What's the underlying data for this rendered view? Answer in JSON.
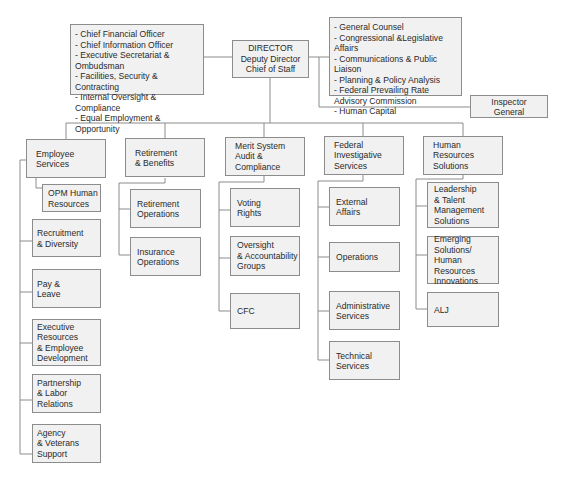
{
  "director": {
    "text": "DIRECTOR\nDeputy Director\nChief of Staff"
  },
  "left_staff": {
    "items": [
      "- Chief Financial Officer",
      "- Chief Information Officer",
      "- Executive Secretariat & Ombudsman",
      "- Facilities, Security & Contracting",
      "- Internal Oversight & Compliance",
      "- Equal Employment & Opportunity"
    ],
    "text": "- Chief Financial Officer\n- Chief Information Officer\n- Executive Secretariat & Ombudsman\n- Facilities, Security & Contracting\n- Internal Oversight & Compliance\n- Equal Employment & Opportunity"
  },
  "right_staff": {
    "items": [
      "- General Counsel",
      "- Congressional & Legislative Affairs",
      "- Communications & Public Liaison",
      "- Planning & Policy Analysis",
      "- Federal Prevailing Rate Advisory Commission",
      "- Human Capital"
    ],
    "text": "- General Counsel\n- Congressional &Legislative Affairs\n- Communications & Public Liaison\n- Planning & Policy Analysis\n- Federal Prevailing Rate\n  Advisory Commission\n- Human Capital"
  },
  "inspector_general": {
    "text": "Inspector\nGeneral"
  },
  "divisions": [
    {
      "text": "Employee\nServices",
      "children": [
        "OPM Human\nResources",
        "Recruitment\n& Diversity",
        "Pay &\nLeave",
        "Executive\nResources\n& Employee\nDevelopment",
        "Partnership\n& Labor\nRelations",
        "Agency\n& Veterans\nSupport"
      ]
    },
    {
      "text": "Retirement\n& Benefits",
      "children": [
        "Retirement\nOperations",
        "Insurance\nOperations"
      ]
    },
    {
      "text": "Merit System\nAudit & Compliance",
      "children": [
        "Voting\nRights",
        "Oversight\n& Accountability\nGroups",
        "CFC"
      ]
    },
    {
      "text": "Federal\nInvestigative\nServices",
      "children": [
        "External\nAffairs",
        "Operations",
        "Administrative\nServices",
        "Technical\nServices"
      ]
    },
    {
      "text": "Human Resources\nSolutions",
      "children": [
        "Leadership\n& Talent\nManagement\nSolutions",
        "Emerging\nSolutions/\nHuman Resources\nInnovations",
        "ALJ"
      ]
    }
  ],
  "colors": {
    "box_fill": "#f1f1f1",
    "box_border": "#8c8c8c",
    "line": "#8c8c8c",
    "text": "#2a2a2a"
  }
}
